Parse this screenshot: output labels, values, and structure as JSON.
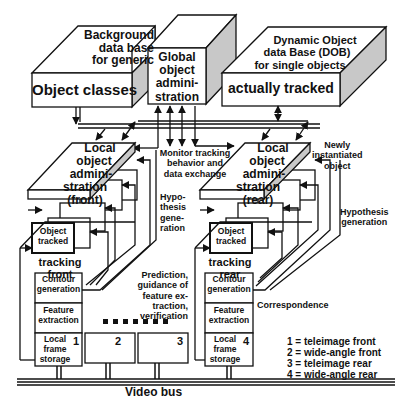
{
  "diagram": {
    "top_blocks": {
      "background_db": {
        "top_text": [
          "Background",
          "data base",
          "for generic"
        ],
        "front_text": "Object classes"
      },
      "global_admin": {
        "text": [
          "Global",
          "object",
          "admini-",
          "stration"
        ]
      },
      "dob": {
        "line1": "Dynamic Object",
        "line2": "data Base (DOB)",
        "line3": "for single objects",
        "front_text": "actually tracked"
      }
    },
    "monitor_label": [
      "Monitor tracking",
      "behavior and",
      "data exchange"
    ],
    "front_branch": {
      "admin_text": [
        "Local",
        "object",
        "admini-",
        "stration",
        "(front)"
      ],
      "object_tracked": [
        "Object",
        "tracked"
      ],
      "tracking_label": [
        "tracking",
        "front"
      ],
      "hypothesis_label": [
        "Hypo-",
        "thesis",
        "gene-",
        "ration"
      ],
      "contour": [
        "Contour",
        "generation"
      ],
      "feature": [
        "Feature",
        "extraction"
      ],
      "frame_storage": [
        "Local",
        "frame",
        "storage"
      ],
      "camera_number": "1"
    },
    "rear_branch": {
      "admin_text": [
        "Local",
        "object",
        "admini-",
        "stration",
        "(rear)"
      ],
      "object_tracked": [
        "Object",
        "tracked"
      ],
      "tracking_label": [
        "tracking",
        "rear"
      ],
      "hypothesis_label": [
        "Hypothesis",
        "generation"
      ],
      "newly_label": [
        "Newly",
        "instantiated",
        "object"
      ],
      "contour": [
        "Contour",
        "generation"
      ],
      "feature": [
        "Feature",
        "extraction"
      ],
      "frame_storage": [
        "Local",
        "frame",
        "storage"
      ],
      "camera_number": "4"
    },
    "prediction_label": [
      "Prediction,",
      "guidance of",
      "feature ex-",
      "traction,",
      "verification"
    ],
    "correspondence_label": "Correspondence",
    "extra_frames": [
      "2",
      "3"
    ],
    "video_bus_label": "Video bus",
    "legend": [
      "1 = teleimage front",
      "2 = wide-angle front",
      "3 = teleimage rear",
      "4 = wide-angle rear"
    ],
    "colors": {
      "line": "#111111",
      "side_face": "#c8c8c8",
      "box_fill": "#ffffff"
    }
  }
}
